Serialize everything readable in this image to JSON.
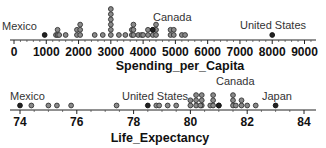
{
  "chart_data": [
    {
      "type": "scatter",
      "subtype": "dotplot",
      "xlabel": "Spending_per_Capita",
      "xlim": [
        0,
        9700
      ],
      "ticks": [
        0,
        1000,
        2000,
        3000,
        4000,
        5000,
        6000,
        7000,
        8000,
        9000
      ],
      "tick_labels": [
        "0",
        "1000",
        "2000",
        "3000",
        "4000",
        "5000",
        "6000",
        "7000",
        "8000",
        "9000"
      ],
      "annotations": [
        {
          "text": "Mexico",
          "x": 900
        },
        {
          "text": "Canada",
          "x": 4400
        },
        {
          "text": "United States",
          "x": 8000
        }
      ],
      "highlighted": [
        {
          "label": "Mexico",
          "x": 950,
          "stack": 0
        },
        {
          "label": "Canada",
          "x": 4300,
          "stack": 1
        },
        {
          "label": "United States",
          "x": 8000,
          "stack": 0
        }
      ],
      "points": [
        {
          "x": 1300,
          "count": 1
        },
        {
          "x": 1350,
          "count": 2
        },
        {
          "x": 1400,
          "count": 1
        },
        {
          "x": 1600,
          "count": 1
        },
        {
          "x": 1950,
          "count": 2
        },
        {
          "x": 2050,
          "count": 3
        },
        {
          "x": 2500,
          "count": 1
        },
        {
          "x": 2750,
          "count": 1
        },
        {
          "x": 3000,
          "count": 6
        },
        {
          "x": 3250,
          "count": 1
        },
        {
          "x": 3450,
          "count": 1
        },
        {
          "x": 3650,
          "count": 2
        },
        {
          "x": 3700,
          "count": 3
        },
        {
          "x": 3850,
          "count": 1
        },
        {
          "x": 3950,
          "count": 1
        },
        {
          "x": 4000,
          "count": 1
        },
        {
          "x": 4150,
          "count": 2
        },
        {
          "x": 4300,
          "count": 2
        },
        {
          "x": 4400,
          "count": 3
        },
        {
          "x": 4850,
          "count": 2
        },
        {
          "x": 4950,
          "count": 2
        },
        {
          "x": 5200,
          "count": 1
        },
        {
          "x": 5300,
          "count": 1
        }
      ]
    },
    {
      "type": "scatter",
      "subtype": "dotplot",
      "xlabel": "Life_Expectancy",
      "xlim": [
        73.8,
        84.4
      ],
      "ticks": [
        74,
        76,
        78,
        80,
        82,
        84
      ],
      "tick_labels": [
        "74",
        "76",
        "78",
        "80",
        "82",
        "84"
      ],
      "annotations": [
        {
          "text": "Mexico",
          "x": 74.0
        },
        {
          "text": "United States",
          "x": 78.5
        },
        {
          "text": "Canada",
          "x": 81.0
        },
        {
          "text": "Japan",
          "x": 83.0
        }
      ],
      "highlighted": [
        {
          "label": "Mexico",
          "x": 74.0,
          "stack": 0
        },
        {
          "label": "United States",
          "x": 78.5,
          "stack": 0
        },
        {
          "label": "Canada",
          "x": 81.0,
          "stack": 0
        },
        {
          "label": "Japan",
          "x": 83.0,
          "stack": 0
        }
      ],
      "points": [
        {
          "x": 74.4,
          "count": 1
        },
        {
          "x": 75.0,
          "count": 1
        },
        {
          "x": 75.3,
          "count": 1
        },
        {
          "x": 75.8,
          "count": 1
        },
        {
          "x": 77.4,
          "count": 1
        },
        {
          "x": 78.8,
          "count": 1
        },
        {
          "x": 78.9,
          "count": 1
        },
        {
          "x": 79.2,
          "count": 1
        },
        {
          "x": 79.5,
          "count": 1
        },
        {
          "x": 80.0,
          "count": 2
        },
        {
          "x": 80.2,
          "count": 3
        },
        {
          "x": 80.4,
          "count": 3
        },
        {
          "x": 80.35,
          "count": 1
        },
        {
          "x": 80.7,
          "count": 1
        },
        {
          "x": 80.8,
          "count": 3
        },
        {
          "x": 81.0,
          "count": 1
        },
        {
          "x": 81.5,
          "count": 3
        },
        {
          "x": 81.6,
          "count": 1
        },
        {
          "x": 81.8,
          "count": 2
        },
        {
          "x": 82.0,
          "count": 1
        },
        {
          "x": 82.3,
          "count": 1
        }
      ]
    }
  ]
}
